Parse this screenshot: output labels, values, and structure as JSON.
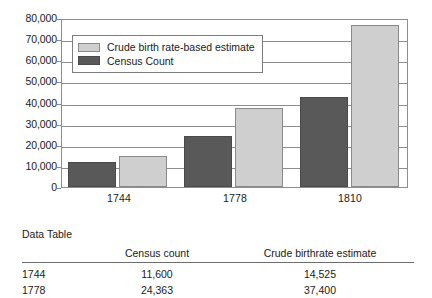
{
  "chart_data": {
    "type": "bar",
    "title": "",
    "xlabel": "",
    "ylabel": "",
    "categories": [
      "1744",
      "1778",
      "1810"
    ],
    "series": [
      {
        "name": "Census Count",
        "key": "census",
        "color": "#595959",
        "values": [
          11600,
          24363,
          42500
        ]
      },
      {
        "name": "Crude birth rate-based estimate",
        "key": "estimate",
        "color": "#cfcfcf",
        "values": [
          14525,
          37400,
          76500
        ]
      }
    ],
    "series_draw_order": [
      "census",
      "estimate"
    ],
    "ylim": [
      0,
      80000
    ],
    "ytick_step": 10000,
    "ytick_labels": [
      "80,000",
      "70,000",
      "60,000",
      "50,000",
      "40,000",
      "30,000",
      "20,000",
      "10,000",
      "0"
    ],
    "ytick_values": [
      80000,
      70000,
      60000,
      50000,
      40000,
      30000,
      20000,
      10000,
      0
    ],
    "grid": true,
    "legend_position": "upper-left-inside",
    "legend_entries": [
      {
        "label": "Crude birth rate-based estimate",
        "swatch": "estimate"
      },
      {
        "label": "Census Count",
        "swatch": "census"
      }
    ]
  },
  "data_table": {
    "caption": "Data Table",
    "columns": [
      "",
      "Census count",
      "Crude birthrate estimate"
    ],
    "rows": [
      {
        "year": "1744",
        "census_count": "11,600",
        "crude_birthrate_estimate": "14,525"
      },
      {
        "year": "1778",
        "census_count": "24,363",
        "crude_birthrate_estimate": "37,400"
      }
    ]
  },
  "colors": {
    "census_bar": "#595959",
    "estimate_bar": "#cfcfcf",
    "axis": "#8d8d8d",
    "text": "#1a1a1a",
    "background": "#ffffff"
  }
}
